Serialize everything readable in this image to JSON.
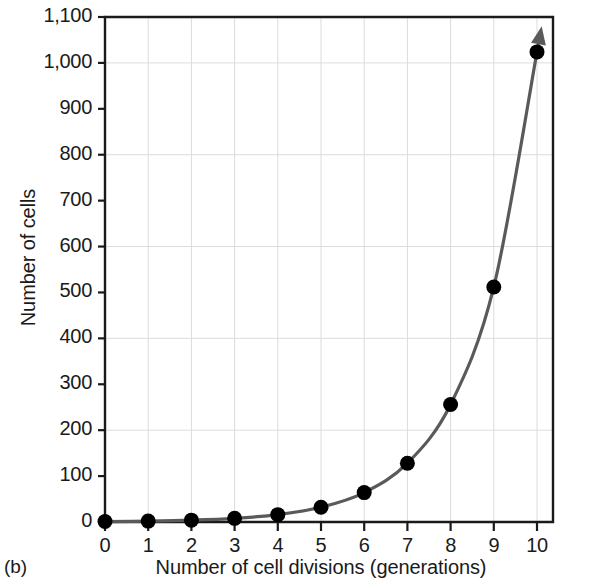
{
  "figure": {
    "panel_caption": "(b)"
  },
  "chart_data": {
    "type": "line",
    "title": "",
    "subtitle": "",
    "xlabel": "Number of cell divisions (generations)",
    "ylabel": "Number of cells",
    "x": [
      0,
      1,
      2,
      3,
      4,
      5,
      6,
      7,
      8,
      9,
      10
    ],
    "values": [
      1,
      2,
      4,
      8,
      16,
      32,
      64,
      128,
      256,
      512,
      1024
    ],
    "series": [
      {
        "name": "Number of cells",
        "values": [
          1,
          2,
          4,
          8,
          16,
          32,
          64,
          128,
          256,
          512,
          1024
        ]
      }
    ],
    "xlim": [
      0,
      10
    ],
    "ylim": [
      0,
      1100
    ],
    "xticks": [
      0,
      1,
      2,
      3,
      4,
      5,
      6,
      7,
      8,
      9,
      10
    ],
    "xtick_labels": [
      "0",
      "1",
      "2",
      "3",
      "4",
      "5",
      "6",
      "7",
      "8",
      "9",
      "10"
    ],
    "yticks": [
      0,
      100,
      200,
      300,
      400,
      500,
      600,
      700,
      800,
      900,
      1000,
      1100
    ],
    "ytick_labels": [
      "0",
      "100",
      "200",
      "300",
      "400",
      "500",
      "600",
      "700",
      "800",
      "900",
      "1,000",
      "1,100"
    ],
    "ygridlines": [
      200,
      400,
      600,
      800,
      1000
    ],
    "xgridlines": [
      1,
      2,
      3,
      4,
      5,
      6,
      7,
      8,
      9,
      10
    ],
    "grid": true,
    "legend": "none",
    "annotations": [
      {
        "type": "arrowhead",
        "at_x": 10,
        "at_y": 1024,
        "direction": "up",
        "note": "curve continues upward beyond plot"
      }
    ],
    "colors": {
      "curve": "#5a5a5a",
      "marker": "#000000",
      "gridline": "#dcdcdc",
      "axis": "#1a1a1a",
      "background": "#ffffff"
    }
  }
}
